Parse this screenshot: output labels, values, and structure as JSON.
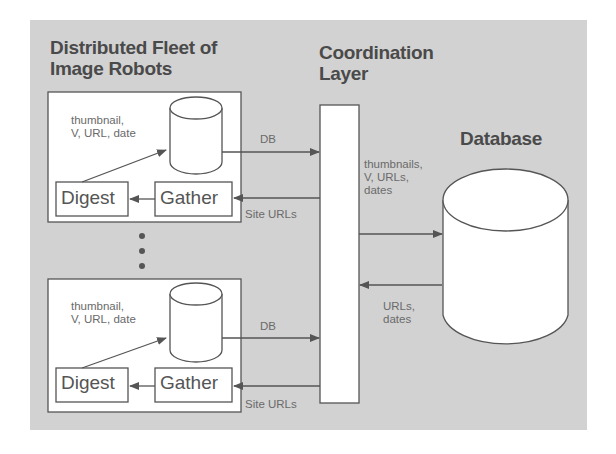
{
  "diagram": {
    "fleet_title_line1": "Distributed Fleet of",
    "fleet_title_line2": "Image Robots",
    "coord_title_line1": "Coordination",
    "coord_title_line2": "Layer",
    "database_title": "Database",
    "robots": [
      {
        "label_line1": "thumbnail,",
        "label_line2": "V, URL, date",
        "digest": "Digest",
        "gather": "Gather",
        "db_arrow": "DB",
        "site_urls": "Site URLs"
      },
      {
        "label_line1": "thumbnail,",
        "label_line2": "V, URL, date",
        "digest": "Digest",
        "gather": "Gather",
        "db_arrow": "DB",
        "site_urls": "Site URLs"
      }
    ],
    "to_db_line1": "thumbnails,",
    "to_db_line2": "V, URLs,",
    "to_db_line3": "dates",
    "from_db_line1": "URLs,",
    "from_db_line2": "dates",
    "colors": {
      "background": "#d2d2d2",
      "line": "#555555",
      "box": "#ffffff"
    }
  }
}
